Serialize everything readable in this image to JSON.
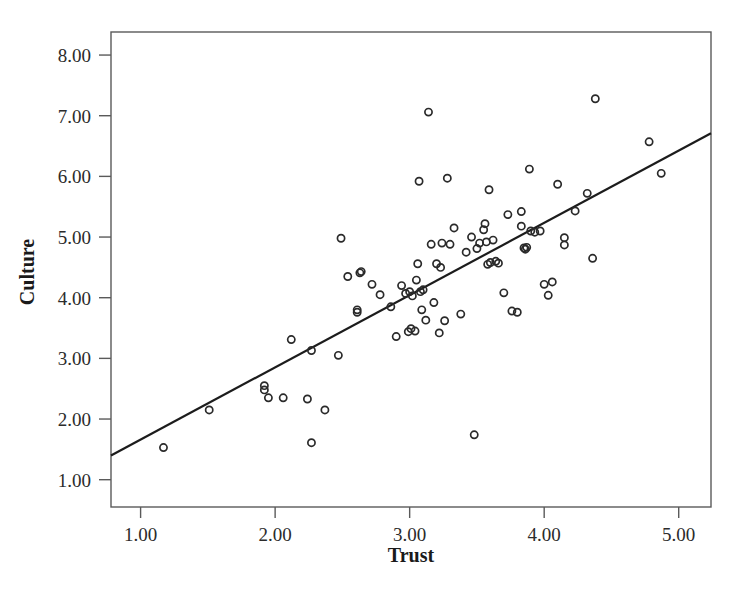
{
  "chart_data": {
    "type": "scatter",
    "title": "",
    "xlabel": "Trust",
    "ylabel": "Culture",
    "xlim": [
      0.78,
      5.24
    ],
    "ylim": [
      0.55,
      8.38
    ],
    "xticks": [
      1.0,
      2.0,
      3.0,
      4.0,
      5.0
    ],
    "yticks": [
      1.0,
      2.0,
      3.0,
      4.0,
      5.0,
      6.0,
      7.0,
      8.0
    ],
    "xticklabels": [
      "1.00",
      "2.00",
      "3.00",
      "4.00",
      "5.00"
    ],
    "yticklabels": [
      "1.00",
      "2.00",
      "3.00",
      "4.00",
      "5.00",
      "6.00",
      "7.00",
      "8.00"
    ],
    "grid": false,
    "legend": null,
    "marker": "open-circle",
    "marker_color": "#2a2a2a",
    "line_color": "#1c1c1c",
    "frame_color": "#5a5a5a",
    "fit_line": {
      "type": "linear",
      "x_start": 0.78,
      "y_start": 1.4,
      "x_end": 5.24,
      "y_end": 6.71,
      "slope": 1.19,
      "intercept": 0.47
    },
    "x": [
      1.17,
      1.51,
      1.92,
      1.92,
      1.95,
      2.06,
      2.12,
      2.24,
      2.27,
      2.27,
      2.37,
      2.47,
      2.49,
      2.54,
      2.61,
      2.61,
      2.63,
      2.64,
      2.72,
      2.78,
      2.86,
      2.9,
      2.94,
      2.97,
      2.99,
      3.0,
      3.01,
      3.02,
      3.04,
      3.05,
      3.06,
      3.07,
      3.08,
      3.09,
      3.1,
      3.12,
      3.14,
      3.16,
      3.18,
      3.2,
      3.22,
      3.23,
      3.24,
      3.26,
      3.28,
      3.3,
      3.33,
      3.38,
      3.42,
      3.46,
      3.48,
      3.5,
      3.52,
      3.55,
      3.56,
      3.57,
      3.58,
      3.59,
      3.6,
      3.62,
      3.64,
      3.66,
      3.7,
      3.73,
      3.76,
      3.8,
      3.83,
      3.83,
      3.85,
      3.86,
      3.87,
      3.89,
      3.9,
      3.93,
      3.97,
      4.0,
      4.03,
      4.06,
      4.1,
      4.15,
      4.15,
      4.23,
      4.32,
      4.36,
      4.38,
      4.78,
      4.87
    ],
    "y": [
      1.53,
      2.15,
      2.55,
      2.48,
      2.35,
      2.35,
      3.31,
      2.33,
      3.13,
      1.61,
      2.15,
      3.05,
      4.98,
      4.35,
      3.8,
      3.76,
      4.41,
      4.43,
      4.22,
      4.05,
      3.85,
      3.36,
      4.2,
      4.07,
      3.44,
      4.1,
      3.49,
      4.03,
      3.45,
      4.29,
      4.56,
      5.92,
      4.1,
      3.8,
      4.13,
      3.63,
      7.06,
      4.88,
      3.92,
      4.56,
      3.42,
      4.5,
      4.9,
      3.62,
      5.97,
      4.88,
      5.15,
      3.73,
      4.75,
      5.0,
      1.74,
      4.81,
      4.9,
      5.12,
      5.22,
      4.92,
      4.55,
      5.78,
      4.58,
      4.95,
      4.6,
      4.57,
      4.08,
      5.37,
      3.78,
      3.76,
      5.42,
      5.18,
      4.82,
      4.8,
      4.83,
      6.12,
      5.1,
      5.08,
      5.1,
      4.22,
      4.04,
      4.26,
      5.87,
      4.99,
      4.87,
      5.43,
      5.72,
      4.65,
      7.28,
      6.57,
      6.05
    ]
  },
  "axes": {
    "x_title": "Trust",
    "y_title": "Culture"
  }
}
